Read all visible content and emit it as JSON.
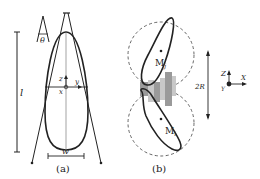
{
  "panels": {
    "a": {
      "caption": "(a)",
      "length_label": "l",
      "width_label": "w",
      "angle_label": "θ",
      "axis_z": "z",
      "axis_y": "y",
      "axis_x": "x"
    },
    "b": {
      "caption": "(b)",
      "upper_body_label": "M",
      "upper_body_sub": "j",
      "lower_body_label": "M",
      "lower_body_sub": "i",
      "distance_label": "2R",
      "frame_z": "Z",
      "frame_x": "X",
      "frame_y": "Y"
    }
  },
  "colors": {
    "stroke": "#222222",
    "dashed": "#555555",
    "gray_bar_dark": "#9a9a9a",
    "gray_bar_light": "#c8c8c8"
  }
}
